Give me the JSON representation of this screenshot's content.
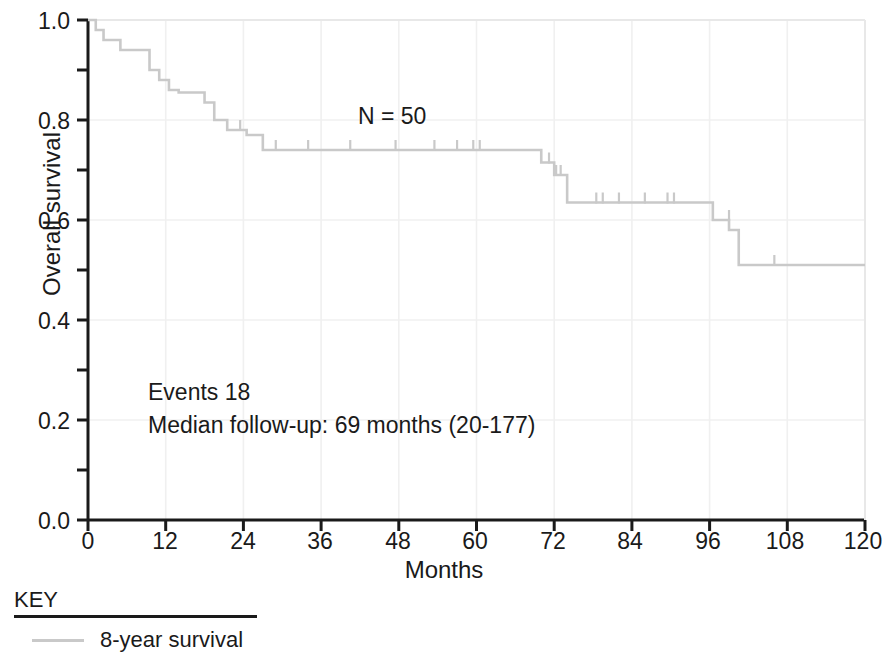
{
  "chart_data": {
    "type": "line",
    "subtype": "kaplan-meier-survival",
    "title": "",
    "xlabel": "Months",
    "ylabel": "Overall survival",
    "xlim": [
      0,
      120
    ],
    "ylim": [
      0.0,
      1.0
    ],
    "xticks": [
      0,
      12,
      24,
      36,
      48,
      60,
      72,
      84,
      96,
      108,
      120
    ],
    "xtick_labels": [
      "0",
      "12",
      "24",
      "36",
      "48",
      "60",
      "72",
      "84",
      "96",
      "108",
      "120"
    ],
    "yticks": [
      0.0,
      0.2,
      0.4,
      0.6,
      0.8,
      1.0
    ],
    "ytick_labels": [
      "0.0",
      "0.2",
      "0.4",
      "0.6",
      "0.8",
      "1.0"
    ],
    "y_minor_ticks": [
      0.1,
      0.3,
      0.5,
      0.7,
      0.9
    ],
    "grid": "faint",
    "legend_position": "below-axes",
    "series": [
      {
        "name": "8-year survival",
        "color": "#c9c9c9",
        "n": 50,
        "events": 18,
        "step_points": [
          [
            0.0,
            1.0
          ],
          [
            1.2,
            1.0
          ],
          [
            1.2,
            0.98
          ],
          [
            2.4,
            0.98
          ],
          [
            2.4,
            0.96
          ],
          [
            5.0,
            0.96
          ],
          [
            5.0,
            0.94
          ],
          [
            9.5,
            0.94
          ],
          [
            9.5,
            0.9
          ],
          [
            11.0,
            0.9
          ],
          [
            11.0,
            0.88
          ],
          [
            12.5,
            0.88
          ],
          [
            12.5,
            0.86
          ],
          [
            14.0,
            0.86
          ],
          [
            14.0,
            0.855
          ],
          [
            18.0,
            0.855
          ],
          [
            18.0,
            0.835
          ],
          [
            19.5,
            0.835
          ],
          [
            19.5,
            0.8
          ],
          [
            21.5,
            0.8
          ],
          [
            21.5,
            0.78
          ],
          [
            24.5,
            0.78
          ],
          [
            24.5,
            0.77
          ],
          [
            27.0,
            0.77
          ],
          [
            27.0,
            0.74
          ],
          [
            70.0,
            0.74
          ],
          [
            70.0,
            0.715
          ],
          [
            72.0,
            0.715
          ],
          [
            72.0,
            0.69
          ],
          [
            74.0,
            0.69
          ],
          [
            74.0,
            0.635
          ],
          [
            96.5,
            0.635
          ],
          [
            96.5,
            0.6
          ],
          [
            99.0,
            0.6
          ],
          [
            99.0,
            0.58
          ],
          [
            100.5,
            0.58
          ],
          [
            100.5,
            0.51
          ],
          [
            120.0,
            0.51
          ]
        ],
        "censor_marks": [
          [
            23.5,
            0.78
          ],
          [
            29.0,
            0.74
          ],
          [
            34.0,
            0.74
          ],
          [
            40.5,
            0.74
          ],
          [
            47.5,
            0.74
          ],
          [
            53.5,
            0.74
          ],
          [
            57.0,
            0.74
          ],
          [
            59.5,
            0.74
          ],
          [
            60.5,
            0.74
          ],
          [
            71.2,
            0.715
          ],
          [
            72.3,
            0.69
          ],
          [
            73.0,
            0.69
          ],
          [
            78.5,
            0.635
          ],
          [
            79.5,
            0.635
          ],
          [
            82.0,
            0.635
          ],
          [
            86.0,
            0.635
          ],
          [
            89.5,
            0.635
          ],
          [
            90.5,
            0.635
          ],
          [
            99.0,
            0.6
          ],
          [
            106.0,
            0.51
          ]
        ]
      }
    ],
    "annotations": [
      {
        "id": "n-annotation",
        "text": "N = 50",
        "x": 39,
        "y": 0.8
      },
      {
        "id": "events-annotation",
        "text": "Events 18",
        "x": 8,
        "y": 0.28
      },
      {
        "id": "median-followup-annotation",
        "text": "Median follow-up: 69 months (20-177)",
        "x": 8,
        "y": 0.22
      }
    ]
  },
  "axes": {
    "x_label": "Months",
    "y_label": "Overall survival",
    "x_tick_labels": [
      "0",
      "12",
      "24",
      "36",
      "48",
      "60",
      "72",
      "84",
      "96",
      "108",
      "120"
    ],
    "y_tick_labels": [
      "1.0",
      "0.8",
      "0.6",
      "0.4",
      "0.2",
      "0.0"
    ]
  },
  "annotations": {
    "n": "N = 50",
    "events": "Events 18",
    "median_followup": "Median follow-up: 69 months (20-177)"
  },
  "key": {
    "title": "KEY",
    "entries": [
      {
        "label": "8-year survival",
        "color": "#c9c9c9"
      }
    ]
  },
  "colors": {
    "curve": "#c9c9c9",
    "axis": "#1a1a1a",
    "grid": "#f0f0f0",
    "text": "#1a1a1a",
    "background": "#ffffff"
  }
}
